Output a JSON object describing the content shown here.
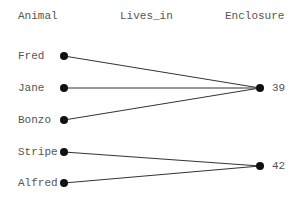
{
  "headers": {
    "left": "Animal",
    "middle": "Lives_in",
    "right": "Enclosure"
  },
  "animals": [
    "Fred",
    "Jane",
    "Bonzo",
    "Stripe",
    "Alfred"
  ],
  "enclosures": [
    "39",
    "42"
  ],
  "relations": [
    {
      "animal": "Fred",
      "enclosure": "39"
    },
    {
      "animal": "Jane",
      "enclosure": "39"
    },
    {
      "animal": "Bonzo",
      "enclosure": "39"
    },
    {
      "animal": "Stripe",
      "enclosure": "42"
    },
    {
      "animal": "Alfred",
      "enclosure": "42"
    }
  ],
  "colors": {
    "line": "#333333",
    "dot": "#111111",
    "text": "#555555"
  }
}
